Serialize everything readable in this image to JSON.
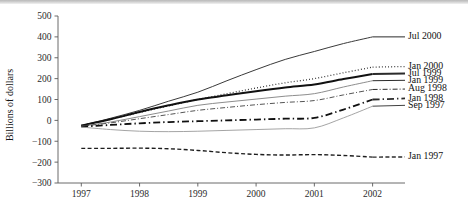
{
  "chart_data": {
    "type": "line",
    "title": "",
    "subtitle": "",
    "xlabel": "",
    "ylabel": "Billions of dollars",
    "xlim": [
      1996.6,
      2002.35
    ],
    "ylim": [
      -300,
      500
    ],
    "ytick_values": [
      500,
      400,
      300,
      200,
      100,
      0,
      -100,
      -200,
      -300
    ],
    "ytick_labels": [
      "500",
      "400",
      "300",
      "200",
      "100",
      "0",
      "−100",
      "−200",
      "−300"
    ],
    "xtick_values": [
      1997,
      1998,
      1999,
      2000,
      2001,
      2002
    ],
    "xtick_labels": [
      "1997",
      "1998",
      "1999",
      "2000",
      "2001",
      "2002"
    ],
    "grid": false,
    "legend_position": "right-inline-labels",
    "x": [
      1997.0,
      1997.5,
      1998.0,
      1998.5,
      1999.0,
      1999.5,
      2000.0,
      2000.5,
      2001.0,
      2001.5,
      2002.0
    ],
    "series": [
      {
        "name": "Jul 2000",
        "label": "Jul 2000",
        "style": "solid",
        "color": "#3a3a3a",
        "width": 1.0,
        "label_y": 400,
        "values": [
          -25,
          10,
          48,
          92,
          135,
          190,
          243,
          292,
          330,
          368,
          400
        ]
      },
      {
        "name": "Jan 2000",
        "label": "Jan 2000",
        "style": "dotted",
        "color": "#2a2a2a",
        "width": 1.3,
        "label_y": 258,
        "values": [
          -25,
          5,
          38,
          70,
          100,
          128,
          155,
          180,
          200,
          228,
          255
        ]
      },
      {
        "name": "Jul 1999",
        "label": "Jul 1999",
        "style": "solid-thick",
        "color": "#111111",
        "width": 2.0,
        "label_y": 224,
        "values": [
          -25,
          5,
          40,
          72,
          100,
          120,
          140,
          158,
          172,
          198,
          222
        ]
      },
      {
        "name": "Jan 1999",
        "label": "Jan 1999",
        "style": "solid-light",
        "color": "#8d8d8d",
        "width": 1.0,
        "label_y": 192,
        "values": [
          -28,
          -8,
          18,
          45,
          72,
          88,
          102,
          116,
          128,
          160,
          190
        ]
      },
      {
        "name": "Aug 1998",
        "label": "Aug 1998",
        "style": "dashdot-fine",
        "color": "#555555",
        "width": 1.0,
        "label_y": 150,
        "values": [
          -28,
          -12,
          8,
          28,
          48,
          62,
          75,
          86,
          95,
          122,
          148
        ]
      },
      {
        "name": "Jan 1998",
        "label": "Jan 1998",
        "style": "dashdot-bold",
        "color": "#101010",
        "width": 1.8,
        "label_y": 105,
        "values": [
          -30,
          -22,
          -14,
          -8,
          -4,
          0,
          4,
          8,
          12,
          52,
          100
        ]
      },
      {
        "name": "Sep 1997",
        "label": "Sep 1997",
        "style": "solid-thin-gray",
        "color": "#9a9a9a",
        "width": 0.9,
        "label_y": 72,
        "values": [
          -32,
          -44,
          -52,
          -54,
          -52,
          -48,
          -44,
          -40,
          -36,
          12,
          68
        ]
      },
      {
        "name": "Jan 1997",
        "label": "Jan 1997",
        "style": "dashed",
        "color": "#1d1d1d",
        "width": 1.4,
        "label_y": -175,
        "values": [
          -134,
          -134,
          -133,
          -136,
          -144,
          -155,
          -163,
          -166,
          -164,
          -168,
          -176
        ]
      }
    ]
  }
}
